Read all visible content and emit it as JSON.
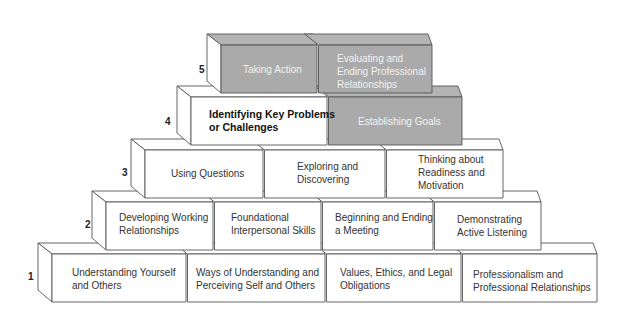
{
  "diagram": {
    "type": "pyramid",
    "colors": {
      "stroke": "#555555",
      "white_face": "#ffffff",
      "white_side": "#ffffff",
      "gray_face": "#aaaaaa",
      "gray_top": "#b4b4b4"
    },
    "levels": [
      {
        "number": "5",
        "blocks": [
          {
            "label": "Taking Action",
            "shaded": true
          },
          {
            "label": "Evaluating and\nEnding Professional\nRelationships",
            "shaded": true
          }
        ]
      },
      {
        "number": "4",
        "blocks": [
          {
            "label": "Identifying Key Problems\nor Challenges",
            "shaded": false,
            "bold": true
          },
          {
            "label": "Establishing Goals",
            "shaded": true
          }
        ]
      },
      {
        "number": "3",
        "blocks": [
          {
            "label": "Using Questions",
            "shaded": false
          },
          {
            "label": "Exploring and\nDiscovering",
            "shaded": false
          },
          {
            "label": "Thinking about\nReadiness and\nMotivation",
            "shaded": false
          }
        ]
      },
      {
        "number": "2",
        "blocks": [
          {
            "label": "Developing Working\nRelationships",
            "shaded": false
          },
          {
            "label": "Foundational\nInterpersonal Skills",
            "shaded": false
          },
          {
            "label": "Beginning and Ending\na Meeting",
            "shaded": false
          },
          {
            "label": "Demonstrating\nActive Listening",
            "shaded": false
          }
        ]
      },
      {
        "number": "1",
        "blocks": [
          {
            "label": "Understanding Yourself\nand Others",
            "shaded": false
          },
          {
            "label": "Ways of Understanding and\nPerceiving Self and Others",
            "shaded": false
          },
          {
            "label": "Values, Ethics, and Legal\nObligations",
            "shaded": false
          },
          {
            "label": "Professionalism and\nProfessional Relationships",
            "shaded": false
          }
        ]
      }
    ]
  }
}
